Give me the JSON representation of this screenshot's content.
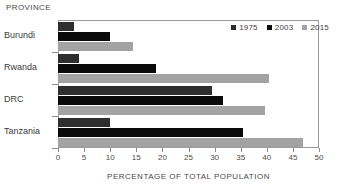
{
  "chart_data": {
    "type": "bar",
    "orientation": "horizontal",
    "title": "",
    "ylabel": "PROVINCE",
    "xlabel": "PERCENTAGE OF TOTAL POPULATION",
    "categories": [
      "Burundi",
      "Rwanda",
      "DRC",
      "Tanzania"
    ],
    "series": [
      {
        "name": "1975",
        "color": "#2e2e2e",
        "values": [
          3.0,
          4.0,
          29.5,
          10.0
        ]
      },
      {
        "name": "2003",
        "color": "#0a0a0a",
        "values": [
          10.0,
          18.7,
          31.6,
          35.5
        ]
      },
      {
        "name": "2015",
        "color": "#a3a3a3",
        "values": [
          14.4,
          40.5,
          39.7,
          47.0
        ]
      }
    ],
    "xlim": [
      0,
      50
    ],
    "xticks": [
      0,
      5,
      10,
      15,
      20,
      25,
      30,
      35,
      40,
      45,
      50
    ],
    "xtick_labels": [
      "0",
      "5",
      "10",
      "15",
      "20",
      "25",
      "30",
      "35",
      "40",
      "45",
      "50"
    ],
    "grid": false,
    "legend_position": "top-right"
  }
}
